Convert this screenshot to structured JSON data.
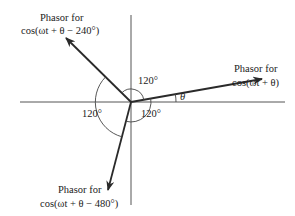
{
  "diagram": {
    "type": "phasor-diagram",
    "origin": {
      "x": 131,
      "y": 102
    },
    "axes": {
      "horizontal": {
        "x1": 20,
        "x2": 285
      },
      "vertical": {
        "y1": 15,
        "y2": 205
      }
    },
    "phasors": [
      {
        "id": "theta",
        "label_line1": "Phasor for",
        "label_line2": "cos(ωt + θ)",
        "tip": {
          "x": 262,
          "y": 79
        }
      },
      {
        "id": "minus-240",
        "label_line1": "Phasor for",
        "label_line2": "cos(ωt + θ − 240°)",
        "tip": {
          "x": 66,
          "y": 38
        }
      },
      {
        "id": "minus-480",
        "label_line1": "Phasor for",
        "label_line2": "cos(ωt + θ − 480°)",
        "tip": {
          "x": 108,
          "y": 190
        }
      }
    ],
    "angles": {
      "theta_label": "θ",
      "top_label": "120°",
      "left_label": "120°",
      "bottom_right_label": "120°"
    },
    "colors": {
      "line": "#2a2a2a",
      "text": "#222222",
      "background": "#ffffff"
    }
  }
}
